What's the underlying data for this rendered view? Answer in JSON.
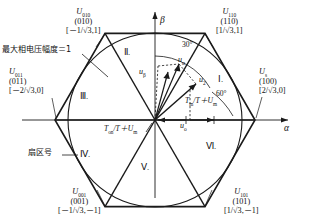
{
  "figure": {
    "type": "space-vector-hexagon",
    "axes": {
      "alpha": "α",
      "beta": "β"
    },
    "angles": {
      "thirty": "30°",
      "sixty": "60°"
    },
    "annotations": {
      "max_phase_amplitude": "最大相电压幅度＝1",
      "sector_number": "扇区号",
      "ton_formula": "T",
      "ton_sub": "on",
      "ton_rest": "/T＋U",
      "ton_rest_sub": "m",
      "tm_formula": "T",
      "tm_sub": "m",
      "tm_rest": "/T＋U",
      "tm_rest_sub": "m"
    },
    "vectors": [
      {
        "name": "u-alpha",
        "symbol": "u",
        "sub": "α"
      },
      {
        "name": "u-beta",
        "symbol": "u",
        "sub": "β"
      },
      {
        "name": "u-two",
        "symbol": "u",
        "sub": "2"
      },
      {
        "name": "u-zero",
        "symbol": "u",
        "sub": "o"
      },
      {
        "name": "u-m",
        "symbol": "U",
        "sub": "m"
      }
    ],
    "sectors": [
      {
        "id": "sector-1",
        "label": "Ⅰ."
      },
      {
        "id": "sector-2",
        "label": "Ⅱ."
      },
      {
        "id": "sector-3",
        "label": "Ⅲ."
      },
      {
        "id": "sector-4",
        "label": "Ⅳ."
      },
      {
        "id": "sector-5",
        "label": "Ⅴ."
      },
      {
        "id": "sector-6",
        "label": "Ⅵ."
      }
    ],
    "vertices": [
      {
        "id": "v-010",
        "symbol": "U",
        "sub": "010",
        "state": "(010)",
        "coord": "[－1/√3,1]"
      },
      {
        "id": "v-110",
        "symbol": "U",
        "sub": "110",
        "state": "(110)",
        "coord": "[1/√3,1]"
      },
      {
        "id": "v-100",
        "symbol": "U",
        "sub": "s",
        "state": "(100)",
        "coord": "[2/√3,0]"
      },
      {
        "id": "v-011",
        "symbol": "U",
        "sub": "011",
        "state": "(011)",
        "coord": "[－2/√3,0]"
      },
      {
        "id": "v-001",
        "symbol": "U",
        "sub": "001",
        "state": "(001)",
        "coord": "[－1/√3,－1]"
      },
      {
        "id": "v-101",
        "symbol": "U",
        "sub": "101",
        "state": "(101)",
        "coord": "[1/√3,－1]"
      }
    ]
  }
}
